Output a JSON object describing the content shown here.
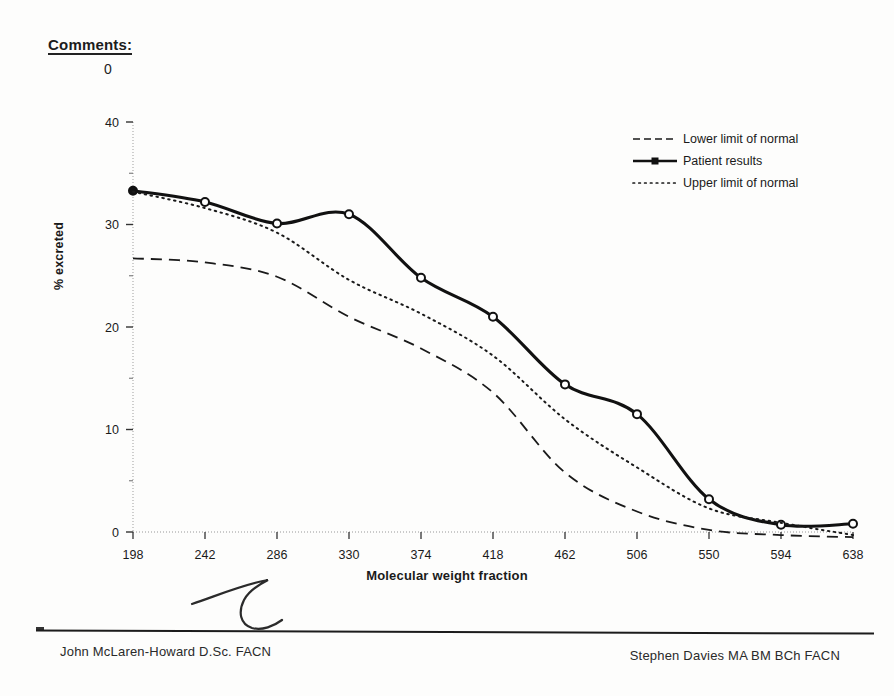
{
  "header": {
    "comments_label": "Comments:",
    "comments_value": "0"
  },
  "legend": {
    "position": "top-right",
    "items": [
      {
        "label": "Lower limit of normal",
        "style": "dashed",
        "icon": "dashed-line-icon"
      },
      {
        "label": "Patient results",
        "style": "solid-marker",
        "icon": "solid-line-marker-icon"
      },
      {
        "label": "Upper limit of normal",
        "style": "dotted",
        "icon": "dotted-line-icon"
      }
    ]
  },
  "footer": {
    "left_name": "John McLaren-Howard D.Sc. FACN",
    "right_name": "Stephen Davies MA BM BCh FACN",
    "annotation": "handwritten-signature-mark"
  },
  "chart_data": {
    "type": "line",
    "title": "",
    "xlabel": "Molecular weight fraction",
    "ylabel": "% excreted",
    "categories": [
      198,
      242,
      286,
      330,
      374,
      418,
      462,
      506,
      550,
      594,
      638
    ],
    "xlim": [
      198,
      638
    ],
    "ylim": [
      0,
      40
    ],
    "yticks": [
      0,
      10,
      20,
      30,
      40
    ],
    "yticks_minor": [
      5,
      15,
      25,
      35
    ],
    "grid": "minor-ticks-only",
    "series": [
      {
        "name": "Lower limit of normal",
        "style": "dashed",
        "color": "#1a1a1a",
        "values": [
          26.7,
          26.3,
          24.9,
          21.0,
          17.9,
          13.6,
          5.8,
          2.0,
          0.2,
          -0.3,
          -0.5
        ]
      },
      {
        "name": "Patient results",
        "style": "solid",
        "marker": "circle",
        "color": "#111111",
        "values": [
          33.3,
          32.2,
          30.1,
          31.0,
          24.8,
          21.0,
          14.4,
          11.5,
          3.2,
          0.7,
          0.8
        ]
      },
      {
        "name": "Upper limit of normal",
        "style": "dotted",
        "color": "#1a1a1a",
        "values": [
          33.2,
          31.6,
          29.2,
          24.6,
          21.3,
          17.2,
          11.0,
          6.3,
          2.3,
          0.9,
          -0.3
        ]
      }
    ]
  }
}
